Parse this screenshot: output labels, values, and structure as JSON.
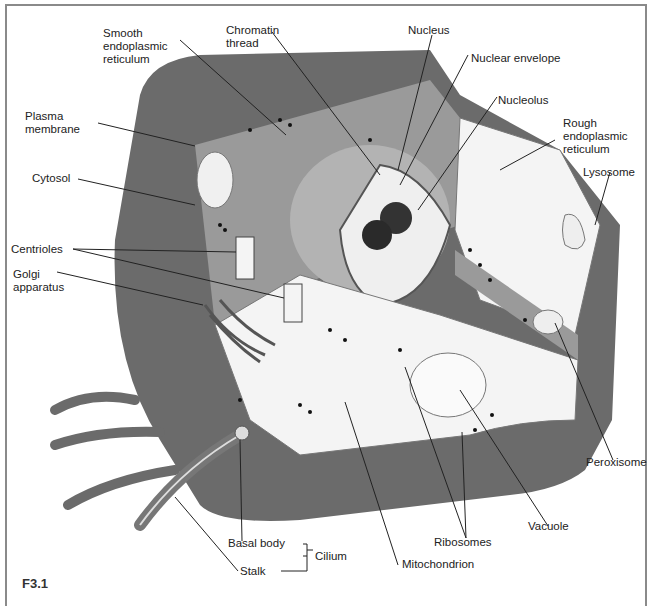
{
  "figure": {
    "id": "F3.1"
  },
  "labels": {
    "smooth_er": "Smooth\nendoplasmic\nreticulum",
    "chromatin": "Chromatin\nthread",
    "nucleus": "Nucleus",
    "nuclear_envelope": "Nuclear envelope",
    "nucleolus": "Nucleolus",
    "rough_er": "Rough\nendoplasmic\nreticulum",
    "lysosome": "Lysosome",
    "plasma_membrane": "Plasma\nmembrane",
    "cytosol": "Cytosol",
    "centrioles": "Centrioles",
    "golgi": "Golgi\napparatus",
    "peroxisome": "Peroxisome",
    "vacuole": "Vacuole",
    "ribosomes": "Ribosomes",
    "mitochondrion": "Mitochondrion",
    "basal_body": "Basal body",
    "stalk": "Stalk",
    "cilium": "Cilium"
  },
  "colors": {
    "membrane": "#6b6b6b",
    "cytosol": "#9a9a9a",
    "cut_face": "#f4f4f4",
    "nucleus_face": "#b8b8b8",
    "text": "#222222"
  }
}
